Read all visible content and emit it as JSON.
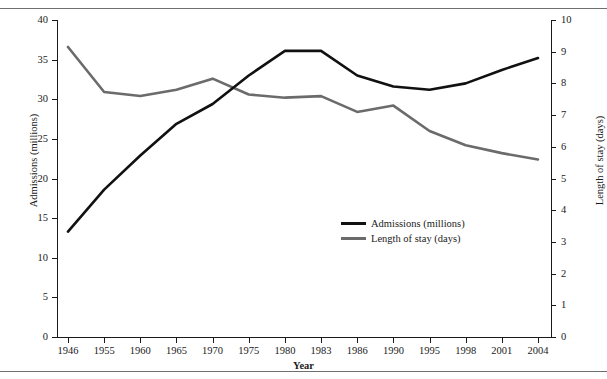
{
  "chart_data": {
    "type": "line",
    "title": "",
    "xlabel": "Year",
    "categories": [
      "1946",
      "1955",
      "1960",
      "1965",
      "1970",
      "1975",
      "1980",
      "1983",
      "1986",
      "1990",
      "1995",
      "1998",
      "2001",
      "2004"
    ],
    "grid": false,
    "legend_position": "center-right-inside",
    "axes": {
      "left": {
        "label": "Admissions (millions)",
        "ticks": [
          "0",
          "5",
          "10",
          "15",
          "20",
          "25",
          "30",
          "35",
          "40"
        ],
        "tick_values": [
          0,
          5,
          10,
          15,
          20,
          25,
          30,
          35,
          40
        ],
        "ylim": [
          0,
          40
        ]
      },
      "right": {
        "label": "Length of stay (days)",
        "ticks": [
          "0",
          "1",
          "2",
          "3",
          "4",
          "5",
          "6",
          "7",
          "8",
          "9",
          "10"
        ],
        "tick_values": [
          0,
          1,
          2,
          3,
          4,
          5,
          6,
          7,
          8,
          9,
          10
        ],
        "ylim": [
          0,
          10
        ]
      }
    },
    "series": [
      {
        "name": "Admissions (millions)",
        "axis": "left",
        "color": "#111111",
        "values": [
          13.3,
          18.6,
          22.9,
          26.9,
          29.4,
          33.0,
          36.1,
          36.1,
          33.0,
          31.6,
          31.2,
          32.0,
          33.7,
          35.2
        ]
      },
      {
        "name": "Length of stay (days)",
        "axis": "right",
        "color": "#6b6b6b",
        "values": [
          9.15,
          7.73,
          7.6,
          7.8,
          8.15,
          7.65,
          7.55,
          7.6,
          7.1,
          7.3,
          6.5,
          6.05,
          5.8,
          5.6
        ]
      }
    ]
  },
  "legend": {
    "items": [
      {
        "label": "Admissions (millions)",
        "color": "#111111"
      },
      {
        "label": "Length of stay (days)",
        "color": "#6b6b6b"
      }
    ]
  }
}
